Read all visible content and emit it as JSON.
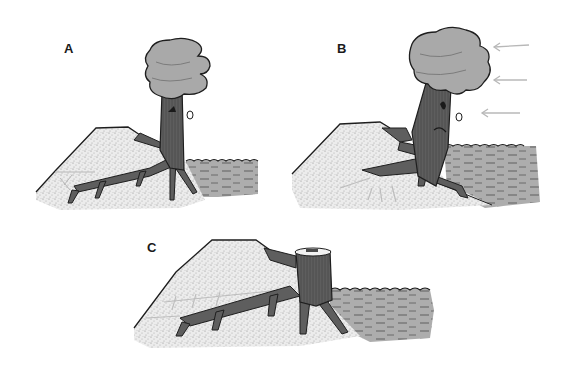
{
  "figure": {
    "colors": {
      "sand": "#e8e8e8",
      "sand_stipple": "#9a9a9a",
      "water": "#a8a8a8",
      "water_lines": "#5a5a5a",
      "trunk": "#5c5c5c",
      "trunk_dark": "#3a3a3a",
      "canopy": "#a9a9a9",
      "outline": "#1e1e1e",
      "wind_arrow": "#b8b8b8"
    },
    "panels": [
      {
        "id": "A",
        "label": "A",
        "state": "upright tree with roots spreading into bank"
      },
      {
        "id": "B",
        "label": "B",
        "state": "tree bent by wind, roots exposed",
        "wind_arrows": 3
      },
      {
        "id": "C",
        "label": "C",
        "state": "cut stump with remaining roots"
      }
    ]
  }
}
